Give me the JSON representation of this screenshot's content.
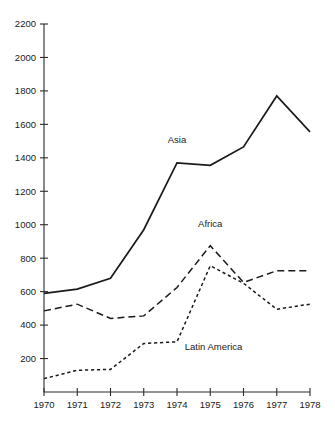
{
  "chart_data": {
    "type": "line",
    "title": "",
    "subtitle": "",
    "xlabel": "",
    "ylabel": "",
    "x": [
      1970,
      1971,
      1972,
      1973,
      1974,
      1975,
      1976,
      1977,
      1978
    ],
    "categories": [
      "1970",
      "1971",
      "1972",
      "1973",
      "1974",
      "1975",
      "1976",
      "1977",
      "1978"
    ],
    "xlim": [
      1970,
      1978
    ],
    "ylim": [
      0,
      2200
    ],
    "yticks": [
      200,
      400,
      600,
      800,
      1000,
      1200,
      1400,
      1600,
      1800,
      2000,
      2200
    ],
    "ytick_labels": [
      "200",
      "400",
      "600",
      "800",
      "1000",
      "1200",
      "1400",
      "1600",
      "1800",
      "2000",
      "2200"
    ],
    "xticks": [
      1970,
      1971,
      1972,
      1973,
      1974,
      1975,
      1976,
      1977,
      1978
    ],
    "xtick_labels": [
      "1970",
      "1971",
      "1972",
      "1973",
      "1974",
      "1975",
      "1976",
      "1977",
      "1978"
    ],
    "grid": false,
    "legend": "inline-annotations",
    "series": [
      {
        "name": "Asia",
        "style": "solid",
        "color": "#1a1a1a",
        "label_x": 1974.0,
        "label_y": 1490,
        "values": [
          590,
          615,
          680,
          970,
          1370,
          1355,
          1465,
          1770,
          1555
        ]
      },
      {
        "name": "Africa",
        "style": "long-dash",
        "color": "#1a1a1a",
        "label_x": 1975.0,
        "label_y": 985,
        "values": [
          485,
          525,
          440,
          455,
          625,
          875,
          655,
          725,
          725
        ]
      },
      {
        "name": "Latin America",
        "style": "short-dash",
        "color": "#1a1a1a",
        "label_x": 1975.1,
        "label_y": 250,
        "values": [
          80,
          130,
          135,
          290,
          300,
          755,
          650,
          495,
          525
        ]
      }
    ]
  }
}
